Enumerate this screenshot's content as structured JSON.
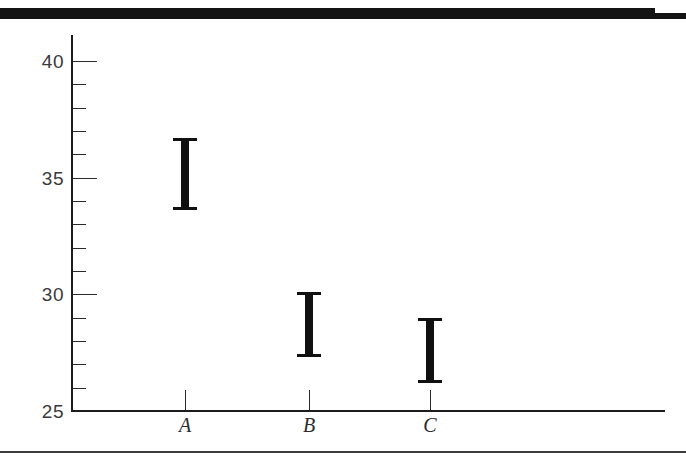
{
  "figure": {
    "top_rule_label": "top-black-band",
    "bottom_rule_label": "bottom-horizontal-rule"
  },
  "chart_data": {
    "type": "bar",
    "title": "",
    "subtitle": "",
    "xlabel": "",
    "ylabel": "",
    "categories": [
      "A",
      "B",
      "C"
    ],
    "ylim": [
      25,
      40
    ],
    "xlim": [
      0,
      4
    ],
    "grid": false,
    "legend": null,
    "y_major_ticks": [
      25,
      30,
      35,
      40
    ],
    "y_major_tick_labels": [
      "25",
      "30",
      "35",
      "40"
    ],
    "y_minor_tick_interval": 1,
    "series": [
      {
        "name": "interval",
        "kind": "error-bar",
        "color": "#101010",
        "values": [
          {
            "category": "A",
            "low": 33.6,
            "high": 36.7,
            "center": 35.15
          },
          {
            "category": "B",
            "low": 27.3,
            "high": 30.1,
            "center": 28.7
          },
          {
            "category": "C",
            "low": 26.2,
            "high": 29.0,
            "center": 27.6
          }
        ]
      }
    ]
  },
  "axis": {
    "y_labels": [
      "40",
      "35",
      "30",
      "25"
    ],
    "x_labels": [
      "A",
      "B",
      "C"
    ]
  }
}
